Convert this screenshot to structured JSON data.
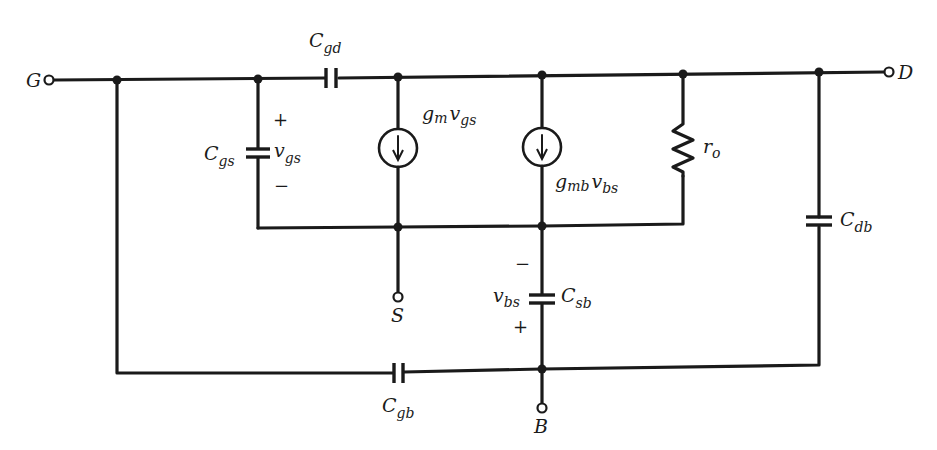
{
  "diagram": {
    "terminals": [
      {
        "id": "G",
        "label": "G"
      },
      {
        "id": "D",
        "label": "D"
      },
      {
        "id": "S",
        "label": "S"
      },
      {
        "id": "B",
        "label": "B"
      }
    ],
    "components": {
      "cgd": {
        "main": "C",
        "sub": "gd"
      },
      "cgs": {
        "main": "C",
        "sub": "gs"
      },
      "vgs": {
        "main": "v",
        "sub": "gs",
        "plus": "+",
        "minus": "−"
      },
      "gm_source": {
        "g": "g",
        "g_sub": "m",
        "v": "v",
        "v_sub": "gs"
      },
      "gmb_source": {
        "g": "g",
        "g_sub": "mb",
        "v": "v",
        "v_sub": "bs"
      },
      "ro": {
        "main": "r",
        "sub": "o"
      },
      "cdb": {
        "main": "C",
        "sub": "db"
      },
      "csb": {
        "main": "C",
        "sub": "sb"
      },
      "vbs": {
        "main": "v",
        "sub": "bs",
        "plus": "+",
        "minus": "−"
      },
      "cgb": {
        "main": "C",
        "sub": "gb"
      }
    },
    "colors": {
      "line": "#1a1a1a",
      "background": "#ffffff"
    }
  }
}
